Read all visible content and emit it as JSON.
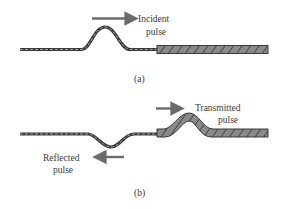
{
  "panels": [
    {
      "id": "a",
      "caption": "(a)",
      "labels": [
        {
          "name": "incident-label",
          "lines": [
            "Incident",
            "pulse"
          ],
          "arrow_direction": "right"
        }
      ]
    },
    {
      "id": "b",
      "caption": "(b)",
      "labels": [
        {
          "name": "transmitted-label",
          "lines": [
            "Transmitted",
            "pulse"
          ],
          "arrow_direction": "right"
        },
        {
          "name": "reflected-label",
          "lines": [
            "Reflected",
            "pulse"
          ],
          "arrow_direction": "left"
        }
      ]
    }
  ],
  "colors": {
    "arrow": "#6b6b6b",
    "light_string": "#5a5a5a",
    "heavy_string_fill": "#8a8a8a",
    "heavy_string_stroke": "#3a3a3a",
    "text": "#3a3a3a"
  }
}
